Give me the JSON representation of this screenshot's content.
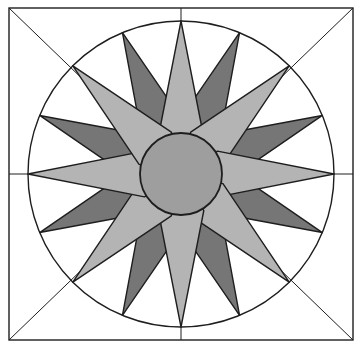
{
  "diagram": {
    "title": "Mariner's compass quilt block",
    "type": "16-point compass star in a circle within a square frame",
    "colors": {
      "background": "#ffffff",
      "stroke": "#1e1e1e",
      "light_spike": "#b4b4b4",
      "dark_spike": "#767676",
      "center_disc": "#9e9e9e",
      "inner_fill": "#8a8a8a"
    },
    "frame": {
      "x": 9,
      "y": 8,
      "width": 344,
      "height": 332
    },
    "center": {
      "x": 181,
      "y": 174
    },
    "outer_circle_radius": 153,
    "inner_circle_radius": 41,
    "light_spikes": {
      "count": 8,
      "tip_radius": 153,
      "half_width_deg": 12
    },
    "dark_spikes": {
      "count": 8,
      "tip_radius": 153,
      "base_radius": 60,
      "half_width_deg": 9
    },
    "guide_lines": [
      "vertical",
      "horizontal",
      "diagonal-tl-br",
      "diagonal-tr-bl"
    ]
  }
}
